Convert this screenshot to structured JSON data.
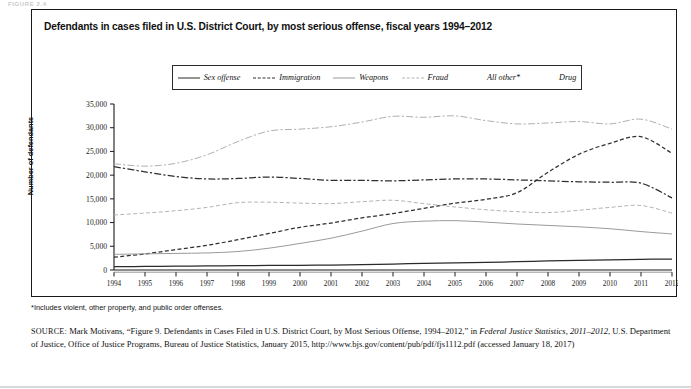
{
  "figure_tag": "FIGURE 2.4",
  "panel": {
    "title": "Defendants in cases filed in U.S. District Court, by most serious offense, fiscal years 1994–2012"
  },
  "footnote": "*Includes violent, other property, and public order offenses.",
  "source": {
    "label": "SOURCE:",
    "text_1": " Mark Motivans, “Figure 9. Defendants in Cases Filed in U.S. District Court, by Most Serious Offense, 1994–2012,” in ",
    "italic_1": "Federal Justice Statistics, 2011–2012",
    "text_2": ", U.S. Department of Justice, Office of Justice Programs, Bureau of Justice Statistics, January 2015, http://www.bjs.gov/content/pub/pdf/fjs1112.pdf (accessed January 18, 2017)"
  },
  "legend": {
    "items": [
      {
        "label": "Sex offense",
        "style": "ls-solid-dark",
        "color": "#2a2a2a"
      },
      {
        "label": "Immigration",
        "style": "ls-dash-dark",
        "color": "#2f2f2f"
      },
      {
        "label": "Weapons",
        "style": "ls-solid-light",
        "color": "#9a9a9a"
      },
      {
        "label": "Fraud",
        "style": "ls-dash-light",
        "color": "#b4b4b4"
      },
      {
        "label": "All other*",
        "style": "ls-dashdot-dark",
        "color": "#2f2f2f"
      },
      {
        "label": "Drug",
        "style": "ls-dashdot-light",
        "color": "#b0b0b0"
      }
    ]
  },
  "chart_data": {
    "type": "line",
    "title": "Defendants in cases filed in U.S. District Court, by most serious offense, fiscal years 1994–2012",
    "xlabel": "",
    "ylabel": "Number of defendants",
    "x": [
      1994,
      1995,
      1996,
      1997,
      1998,
      1999,
      2000,
      2001,
      2002,
      2003,
      2004,
      2005,
      2006,
      2007,
      2008,
      2009,
      2010,
      2011,
      2012
    ],
    "xtick_labels": [
      "1994",
      "1995",
      "1996",
      "1997",
      "1998",
      "1999",
      "2000",
      "2001",
      "2002",
      "2003",
      "2004",
      "2005",
      "2006",
      "2007",
      "2008",
      "2009",
      "2010",
      "2011",
      "2012"
    ],
    "ytick_labels": [
      "0",
      "5,000",
      "10,000",
      "15,000",
      "20,000",
      "25,000",
      "30,000",
      "35,000"
    ],
    "yticks": [
      0,
      5000,
      10000,
      15000,
      20000,
      25000,
      30000,
      35000
    ],
    "ylim": [
      0,
      35000
    ],
    "xlim": [
      1994,
      2012
    ],
    "grid": false,
    "legend_position": "top-center",
    "series": [
      {
        "name": "Sex offense",
        "style": "solid",
        "color": "#2a2a2a",
        "values": [
          700,
          750,
          800,
          850,
          900,
          950,
          1000,
          1050,
          1150,
          1250,
          1400,
          1500,
          1600,
          1750,
          1900,
          2050,
          2150,
          2250,
          2300
        ]
      },
      {
        "name": "Immigration",
        "style": "dashed",
        "color": "#2f2f2f",
        "values": [
          2700,
          3400,
          4300,
          5200,
          6400,
          7700,
          9000,
          9900,
          11000,
          11900,
          13000,
          14100,
          14900,
          16300,
          20600,
          24400,
          26700,
          28100,
          24600
        ]
      },
      {
        "name": "Weapons",
        "style": "solid",
        "color": "#9a9a9a",
        "values": [
          3300,
          3400,
          3500,
          3600,
          3900,
          4600,
          5600,
          6700,
          8200,
          9800,
          10300,
          10400,
          10100,
          9700,
          9400,
          9100,
          8700,
          8100,
          7600
        ]
      },
      {
        "name": "Fraud",
        "style": "dashed",
        "color": "#b4b4b4",
        "values": [
          11600,
          12000,
          12500,
          13200,
          14200,
          14300,
          14100,
          14000,
          14400,
          14700,
          14000,
          13300,
          12700,
          12300,
          12100,
          12600,
          13200,
          13600,
          12000
        ]
      },
      {
        "name": "All other*",
        "style": "dash-dot",
        "color": "#2f2f2f",
        "values": [
          21800,
          20700,
          19700,
          19200,
          19300,
          19600,
          19300,
          18900,
          18900,
          18800,
          19000,
          19200,
          19200,
          19000,
          18800,
          18600,
          18500,
          18300,
          15200
        ]
      },
      {
        "name": "Drug",
        "style": "dash-dot",
        "color": "#b0b0b0",
        "values": [
          22400,
          21900,
          22500,
          24300,
          27100,
          29300,
          29700,
          30200,
          31200,
          32400,
          32200,
          32500,
          31500,
          30800,
          31000,
          31300,
          30800,
          31800,
          29700
        ]
      }
    ]
  }
}
